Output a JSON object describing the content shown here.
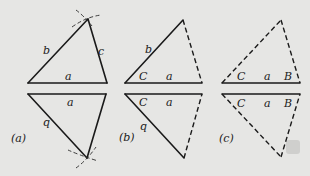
{
  "figure": {
    "panels": [
      {
        "caption": "(a)",
        "upper": {
          "labels": {
            "side_a": "a",
            "side_b": "b",
            "side_c": "c"
          }
        },
        "lower": {
          "labels": {
            "side_a": "a",
            "side_b": "b"
          }
        },
        "description": "Triangle constructed from three sides a, b, c using compass arcs; mirrored copy below side a"
      },
      {
        "caption": "(b)",
        "upper": {
          "labels": {
            "side_a": "a",
            "side_b": "b",
            "angle_C": "C"
          }
        },
        "lower": {
          "labels": {
            "side_a": "a",
            "side_b": "b",
            "angle_C": "C"
          }
        },
        "description": "Triangle determined by two sides a, b and included angle C; third side dashed"
      },
      {
        "caption": "(c)",
        "upper": {
          "labels": {
            "side_a": "a",
            "angle_C": "C",
            "angle_B": "B"
          }
        },
        "lower": {
          "labels": {
            "side_a": "a",
            "angle_C": "C",
            "angle_B": "B"
          }
        },
        "description": "Triangle determined by side a and two angles B, C; other sides dashed"
      }
    ]
  }
}
